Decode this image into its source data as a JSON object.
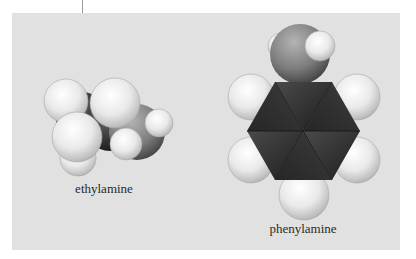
{
  "figure": {
    "panel_color": "#e1e1e1",
    "leader_line_color": "#9a9a9a",
    "molecules": [
      {
        "name": "ethylamine",
        "label": "ethylamine",
        "model": "space-filling",
        "atoms": {
          "carbon_color": "#2e2e2e",
          "nitrogen_color": "#8a8a8a",
          "hydrogen_color": "#f2f2f2"
        }
      },
      {
        "name": "phenylamine",
        "label": "phenylamine",
        "model": "space-filling",
        "atoms": {
          "carbon_color": "#2e2e2e",
          "nitrogen_color": "#8a8a8a",
          "hydrogen_color": "#f2f2f2"
        }
      }
    ]
  }
}
